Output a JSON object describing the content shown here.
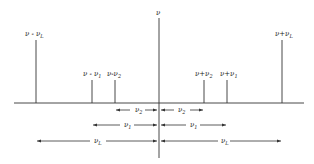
{
  "diagram": {
    "center_label": "ν",
    "lines": [
      {
        "id": "nu-minus-nuL",
        "label": "ν - ν",
        "sub": "L",
        "x": 36,
        "top": 30
      },
      {
        "id": "nu-minus-nu1",
        "label": "ν - ν",
        "sub": "1",
        "x": 92,
        "top": 76
      },
      {
        "id": "nu-minus-nu2",
        "label": "ν-ν",
        "sub": "2",
        "x": 115,
        "top": 76
      },
      {
        "id": "nu-plus-nu2",
        "label": "ν+ν",
        "sub": "2",
        "x": 204,
        "top": 76
      },
      {
        "id": "nu-plus-nu1",
        "label": "ν+ν",
        "sub": "1",
        "x": 227,
        "top": 76
      },
      {
        "id": "nu-plus-nuL",
        "label": "ν+ν",
        "sub": "L",
        "x": 282,
        "top": 30
      }
    ],
    "intervals": [
      {
        "label": "ν",
        "sub": "2",
        "y": 110
      },
      {
        "label": "ν",
        "sub": "1",
        "y": 125
      },
      {
        "label": "ν",
        "sub": "L",
        "y": 141
      }
    ],
    "colors": {
      "line": "#333333",
      "background": "#ffffff"
    }
  }
}
